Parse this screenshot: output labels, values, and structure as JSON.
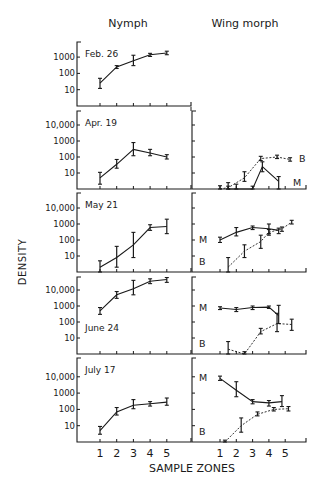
{
  "chart_data": {
    "type": "line",
    "title": "",
    "column_titles": [
      "Nymph",
      "Wing morph"
    ],
    "ylabel": "DENSITY",
    "xlabel": "SAMPLE ZONES",
    "x": [
      1,
      2,
      3,
      4,
      5
    ],
    "x_tick_labels": [
      "1",
      "2",
      "3",
      "4",
      "5"
    ],
    "yscale": "log",
    "y_tick_labels": [
      "10",
      "100",
      "1000",
      "10,000"
    ],
    "error_bars": true,
    "panels": [
      {
        "date": "Feb. 26",
        "nymph": {
          "values": [
            25,
            250,
            600,
            1400,
            1800
          ],
          "lower": [
            12,
            200,
            300,
            1100,
            1400
          ],
          "upper": [
            50,
            300,
            1300,
            1700,
            2300
          ]
        },
        "wing_morph": null
      },
      {
        "date": "Apr. 19",
        "nymph": {
          "values": [
            5,
            35,
            300,
            180,
            100
          ],
          "lower": [
            2,
            20,
            120,
            120,
            75
          ],
          "upper": [
            11,
            70,
            800,
            300,
            140
          ]
        },
        "wing_morph": {
          "M": {
            "values": [
              1,
              1,
              1,
              25,
              3
            ],
            "lower": [
              1,
              1,
              1,
              12,
              1
            ],
            "upper": [
              1.5,
              2,
              1.5,
              50,
              6
            ],
            "x": [
              1.5,
              2.0,
              3.0,
              3.6,
              4.6
            ]
          },
          "B": {
            "values": [
              1,
              1.2,
              5,
              80,
              100,
              70
            ],
            "lower": [
              1,
              1,
              3,
              60,
              80,
              55
            ],
            "upper": [
              1.6,
              2.5,
              12,
              110,
              130,
              90
            ],
            "x": [
              1.0,
              1.5,
              2.5,
              3.5,
              4.5,
              5.3
            ]
          }
        }
      },
      {
        "date": "May 21",
        "nymph": {
          "values": [
            2,
            8,
            50,
            600,
            700
          ],
          "lower": [
            1,
            2,
            8,
            400,
            250
          ],
          "upper": [
            5,
            40,
            300,
            900,
            2000
          ]
        },
        "wing_morph": {
          "M": {
            "values": [
              100,
              300,
              600,
              500,
              400
            ],
            "lower": [
              70,
              180,
              450,
              250,
              250
            ],
            "upper": [
              150,
              600,
              750,
              1000,
              550
            ],
            "x": [
              1.0,
              2.0,
              3.0,
              4.0,
              4.6
            ]
          },
          "B": {
            "values": [
              2,
              20,
              80,
              300,
              500,
              1300
            ],
            "lower": [
              1,
              8,
              30,
              200,
              350,
              1000
            ],
            "upper": [
              8,
              50,
              200,
              450,
              650,
              1700
            ],
            "x": [
              1.5,
              2.5,
              3.5,
              4.0,
              4.8,
              5.4
            ]
          }
        }
      },
      {
        "date": "June 24",
        "nymph": {
          "values": [
            500,
            5000,
            12000,
            35000,
            45000
          ],
          "lower": [
            300,
            3000,
            5000,
            25000,
            30000
          ],
          "upper": [
            800,
            8000,
            40000,
            50000,
            60000
          ]
        },
        "wing_morph": {
          "M": {
            "values": [
              750,
              600,
              800,
              850,
              250
            ],
            "lower": [
              600,
              450,
              600,
              700,
              80
            ],
            "upper": [
              900,
              800,
              1000,
              1000,
              1100
            ],
            "x": [
              1.0,
              2.0,
              3.0,
              4.0,
              4.6
            ]
          },
          "B": {
            "values": [
              2,
              1,
              25,
              80,
              70
            ],
            "lower": [
              1,
              1,
              18,
              25,
              30
            ],
            "upper": [
              6,
              1.4,
              40,
              350,
              150
            ],
            "x": [
              1.5,
              2.5,
              3.5,
              4.5,
              5.4
            ]
          }
        }
      },
      {
        "date": "July 17",
        "nymph": {
          "values": [
            5,
            70,
            180,
            220,
            280
          ],
          "lower": [
            3,
            45,
            110,
            160,
            180
          ],
          "upper": [
            9,
            130,
            400,
            300,
            500
          ]
        },
        "wing_morph": {
          "M": {
            "values": [
              8000,
              1500,
              300,
              250,
              300
            ],
            "lower": [
              6000,
              600,
              220,
              160,
              150
            ],
            "upper": [
              11000,
              5000,
              400,
              350,
              700
            ],
            "x": [
              1.0,
              2.0,
              3.0,
              4.0,
              4.8
            ]
          },
          "B": {
            "values": [
              1,
              10,
              50,
              100,
              110
            ],
            "lower": [
              1,
              4,
              40,
              80,
              80
            ],
            "upper": [
              1.3,
              30,
              70,
              130,
              150
            ],
            "x": [
              1.3,
              2.3,
              3.3,
              4.3,
              5.2
            ]
          }
        }
      }
    ],
    "series_labels": {
      "M": "M",
      "B": "B"
    },
    "legend": "Series labels M (solid) and B (dashed) placed inline",
    "grid": false
  }
}
